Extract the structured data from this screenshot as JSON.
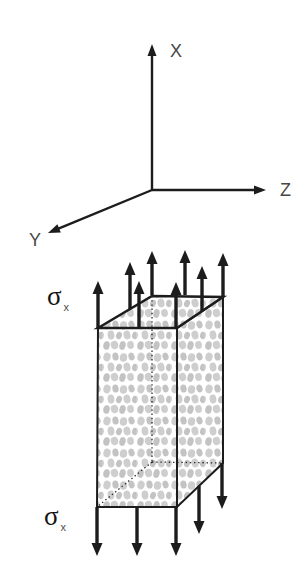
{
  "figure": {
    "background": "#ffffff",
    "line_color": "#1c1c1c",
    "axis_label_color": "#474747",
    "hidden_edge_color": "#2a2a2a",
    "texture_colors": [
      "#cecece",
      "#c3c3c3"
    ]
  },
  "axes": {
    "items": [
      {
        "name": "x-axis",
        "label": "X",
        "from": [
          152,
          190
        ],
        "to": [
          152,
          44
        ],
        "label_pos": [
          170,
          42
        ]
      },
      {
        "name": "z-axis",
        "label": "Z",
        "from": [
          152,
          190
        ],
        "to": [
          266,
          190
        ],
        "label_pos": [
          280,
          181
        ]
      },
      {
        "name": "y-axis",
        "label": "Y",
        "from": [
          152,
          190
        ],
        "to": [
          48,
          233
        ],
        "label_pos": [
          29,
          231
        ]
      }
    ]
  },
  "block": {
    "corners": {
      "flt": [
        98,
        328
      ],
      "frt": [
        177,
        328
      ],
      "brt": [
        223,
        297
      ],
      "blt": [
        152,
        296
      ],
      "flb": [
        97,
        507
      ],
      "frb": [
        177,
        507
      ],
      "brb": [
        223,
        463
      ],
      "blb": [
        152,
        462
      ]
    },
    "texture": {
      "tile": [
        34,
        32
      ],
      "blobs": [
        [
          5,
          5,
          3.6,
          4.4,
          15
        ],
        [
          13.5,
          4.5,
          3.1,
          4,
          -12
        ],
        [
          21.5,
          5.5,
          3.7,
          4.3,
          8
        ],
        [
          29.5,
          4.5,
          3,
          3.9,
          -18
        ],
        [
          9,
          15,
          3.4,
          4.5,
          -8
        ],
        [
          17,
          15.5,
          2.9,
          3.7,
          20
        ],
        [
          25,
          15,
          3.5,
          4.4,
          -14
        ],
        [
          33,
          15.5,
          2.9,
          3.8,
          10
        ],
        [
          -1,
          15.5,
          2.9,
          3.8,
          10
        ],
        [
          4.5,
          25.5,
          3.2,
          4.3,
          12
        ],
        [
          12.5,
          25,
          3.7,
          4.1,
          -16
        ],
        [
          20.5,
          25.5,
          3.1,
          4.4,
          14
        ],
        [
          28.5,
          25,
          3.4,
          3.9,
          -6
        ]
      ]
    }
  },
  "stress_arrows": {
    "up": [
      [
        98,
        328,
        281
      ],
      [
        130,
        309,
        262
      ],
      [
        139,
        328,
        281
      ],
      [
        152,
        295,
        251
      ],
      [
        176,
        328,
        282
      ],
      [
        185,
        295,
        250
      ],
      [
        202,
        311,
        266
      ],
      [
        223,
        297,
        253
      ]
    ],
    "down": [
      [
        97,
        507,
        556
      ],
      [
        137,
        507,
        556
      ],
      [
        176,
        507,
        556
      ],
      [
        199,
        486,
        534
      ],
      [
        222,
        463,
        509
      ]
    ]
  },
  "labels": {
    "sigma_top": {
      "symbol": "σ",
      "subscript": "x",
      "pos": [
        47,
        283
      ]
    },
    "sigma_bottom": {
      "symbol": "σ",
      "subscript": "x",
      "pos": [
        44,
        503
      ]
    }
  }
}
